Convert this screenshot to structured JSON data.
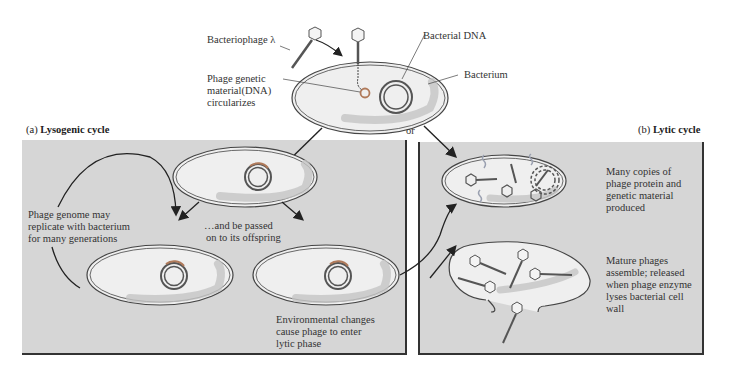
{
  "top": {
    "bacteriophage_label": "Bacteriophage λ",
    "phage_dna_label": [
      "Phage genetic",
      "material(DNA)",
      "circularizes"
    ],
    "bacterial_dna_label": "Bacterial DNA",
    "bacterium_label": "Bacterium",
    "or_label": "or"
  },
  "lysogenic": {
    "title_letter": "(a)",
    "title": "Lysogenic cycle",
    "replicate_label": [
      "Phage genome may",
      "replicate with bacterium",
      "for many generations"
    ],
    "passed_label": [
      "…and be passed",
      "on to its offspring"
    ],
    "environment_label": [
      "Environmental changes",
      "cause phage to enter",
      "lytic phase"
    ]
  },
  "lytic": {
    "title_letter": "(b)",
    "title": "Lytic cycle",
    "copies_label": [
      "Many copies of",
      "phage protein and",
      "genetic material",
      "produced"
    ],
    "mature_label": [
      "Mature phages",
      "assemble; released",
      "when phage enzyme",
      "lyses bacterial cell",
      "wall"
    ]
  },
  "colors": {
    "panel_bg": "#d6d6d6",
    "cell_fill": "#efefef",
    "outline": "#444444",
    "phage_dna": "#b07a5a",
    "bacterial_dna": "#555555"
  }
}
